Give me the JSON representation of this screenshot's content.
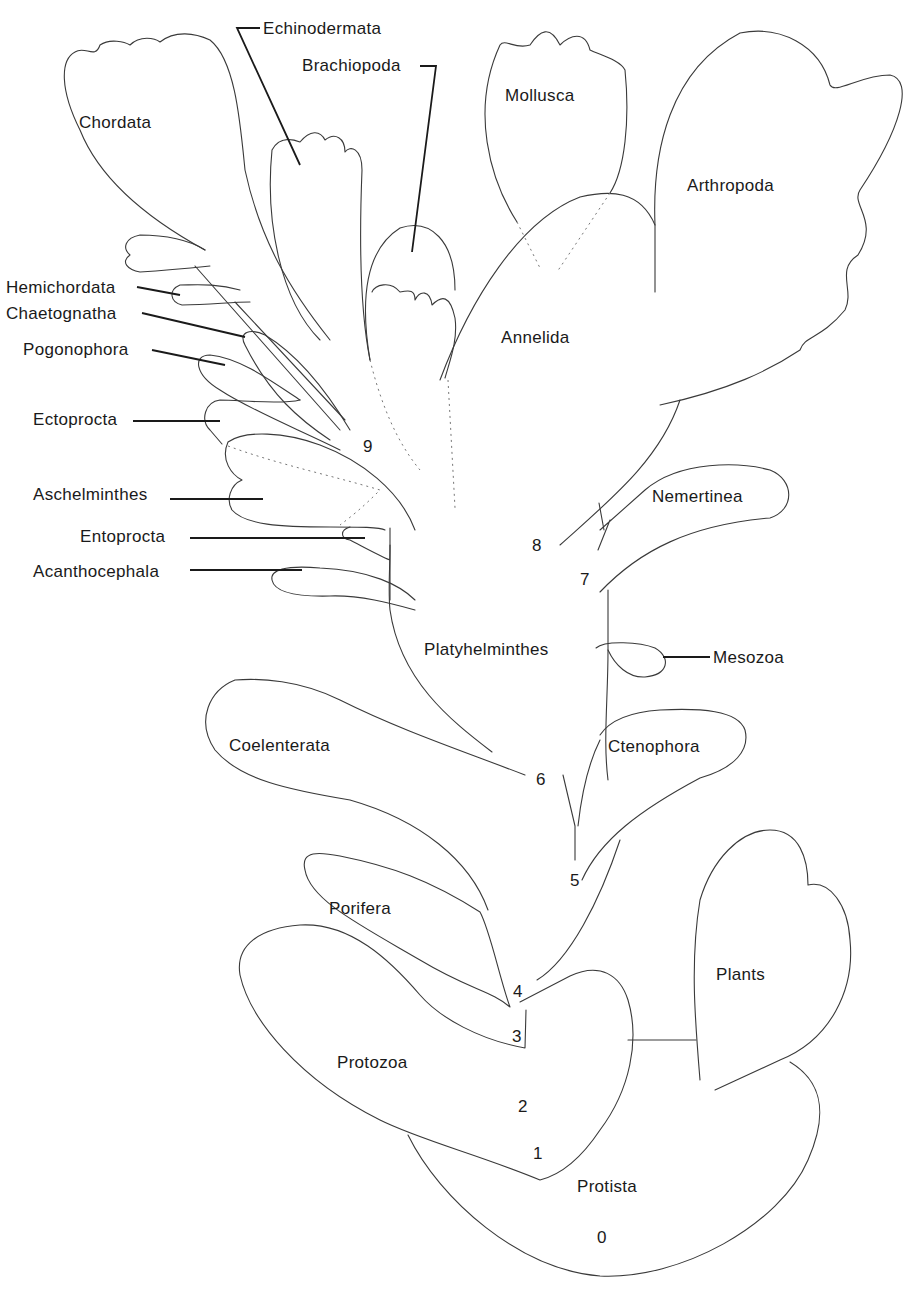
{
  "diagram": {
    "type": "phylogenetic-tree",
    "taxa": [
      {
        "id": "chordata",
        "label": "Chordata"
      },
      {
        "id": "echinodermata",
        "label": "Echinodermata"
      },
      {
        "id": "brachiopoda",
        "label": "Brachiopoda"
      },
      {
        "id": "mollusca",
        "label": "Mollusca"
      },
      {
        "id": "arthropoda",
        "label": "Arthropoda"
      },
      {
        "id": "annelida",
        "label": "Annelida"
      },
      {
        "id": "hemichordata",
        "label": "Hemichordata"
      },
      {
        "id": "chaetognatha",
        "label": "Chaetognatha"
      },
      {
        "id": "pogonophora",
        "label": "Pogonophora"
      },
      {
        "id": "ectoprocta",
        "label": "Ectoprocta"
      },
      {
        "id": "aschelminthes",
        "label": "Aschelminthes"
      },
      {
        "id": "entoprocta",
        "label": "Entoprocta"
      },
      {
        "id": "acanthocephala",
        "label": "Acanthocephala"
      },
      {
        "id": "nemertinea",
        "label": "Nemertinea"
      },
      {
        "id": "platyhelminthes",
        "label": "Platyhelminthes"
      },
      {
        "id": "mesozoa",
        "label": "Mesozoa"
      },
      {
        "id": "coelenterata",
        "label": "Coelenterata"
      },
      {
        "id": "ctenophora",
        "label": "Ctenophora"
      },
      {
        "id": "porifera",
        "label": "Porifera"
      },
      {
        "id": "plants",
        "label": "Plants"
      },
      {
        "id": "protozoa",
        "label": "Protozoa"
      },
      {
        "id": "protista",
        "label": "Protista"
      }
    ],
    "branch_points": [
      "0",
      "1",
      "2",
      "3",
      "4",
      "5",
      "6",
      "7",
      "8",
      "9"
    ],
    "colors": {
      "line": "#3a3a3a",
      "text": "#1a1a1a",
      "background": "#ffffff"
    }
  }
}
